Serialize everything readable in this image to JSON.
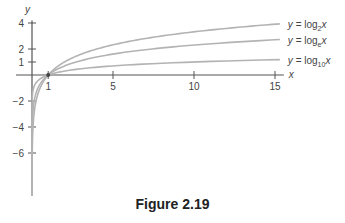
{
  "chart_data": {
    "type": "line",
    "title": "",
    "xlabel": "x",
    "ylabel": "y",
    "xlim": [
      0,
      15.3
    ],
    "ylim": [
      -8,
      4.5
    ],
    "x_ticks": [
      1,
      5,
      10,
      15
    ],
    "y_ticks": [
      4,
      2,
      1,
      -2,
      -4,
      -6
    ],
    "grid": false,
    "legend_position": "inline-right",
    "series": [
      {
        "name": "y = log2 x",
        "base": 2,
        "label_main": "y = log",
        "label_sub": "2",
        "label_var": "x",
        "color": "#b3b3b3"
      },
      {
        "name": "y = loge x",
        "base": 2.718281828,
        "label_main": "y = log",
        "label_sub": "e",
        "label_var": "x",
        "color": "#b3b3b3"
      },
      {
        "name": "y = log10 x",
        "base": 10,
        "label_main": "y = log",
        "label_sub": "10",
        "label_var": "x",
        "color": "#b3b3b3"
      }
    ],
    "sample_points": {
      "x": [
        0.0625,
        0.125,
        0.25,
        0.5,
        1,
        2,
        5,
        10,
        15
      ],
      "log2": [
        -4,
        -3,
        -2,
        -1,
        0,
        1,
        2.32,
        3.32,
        3.91
      ],
      "loge": [
        -2.77,
        -2.08,
        -1.39,
        -0.69,
        0,
        0.69,
        1.61,
        2.3,
        2.71
      ],
      "log10": [
        -1.2,
        -0.9,
        -0.6,
        -0.3,
        0,
        0.3,
        0.7,
        1.0,
        1.18
      ]
    }
  },
  "axes": {
    "x_label": "x",
    "y_label": "y"
  },
  "caption": "Figure 2.19"
}
